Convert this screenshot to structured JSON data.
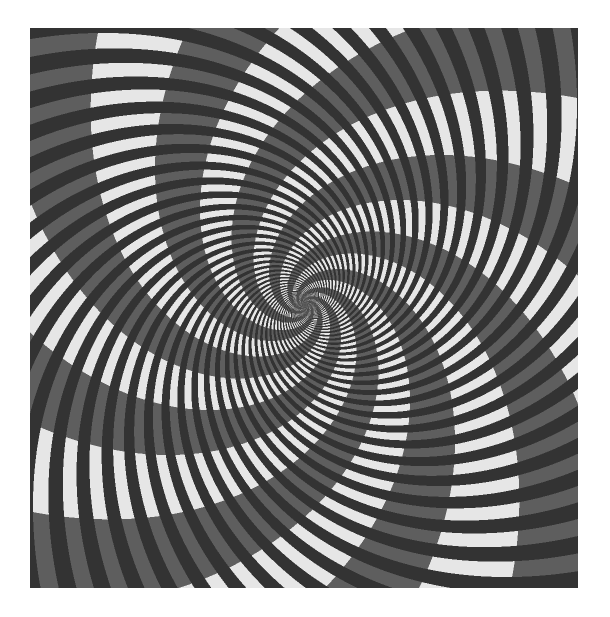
{
  "image": {
    "kind": "spiral optical illusion",
    "frame": {
      "x": 30,
      "y": 28,
      "width": 548,
      "height": 560
    },
    "center": {
      "x": 275,
      "y": 277
    },
    "colors": {
      "background": "#ffffff",
      "dark_stripe": "#333333",
      "light_segment": "#e6e6e6",
      "gray_segment": "#5e5e5e"
    },
    "stripes": {
      "arm_count": 40,
      "twist": 1.35,
      "dark_fraction": 0.5
    },
    "bands": {
      "arm_count": 8,
      "twist": -1.1,
      "light_fraction": 0.5
    }
  }
}
